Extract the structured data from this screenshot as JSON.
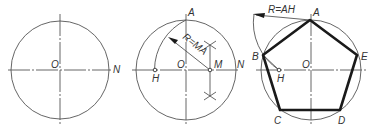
{
  "figures": [
    {
      "id": "step1",
      "labels": {
        "center": "O",
        "right_point": "N"
      }
    },
    {
      "id": "step2",
      "labels": {
        "top": "A",
        "center": "O",
        "midpoint": "M",
        "right_point": "N",
        "arc_point": "H",
        "radius": "R=MA"
      }
    },
    {
      "id": "step3",
      "labels": {
        "top": "A",
        "left": "B",
        "right": "E",
        "bottom_left": "C",
        "bottom_right": "D",
        "center": "O",
        "arc_point": "H",
        "radius": "R=AH"
      }
    }
  ],
  "colors": {
    "line": "#555555",
    "bold": "#1a1a1a",
    "text": "#333333",
    "background": "#ffffff"
  }
}
